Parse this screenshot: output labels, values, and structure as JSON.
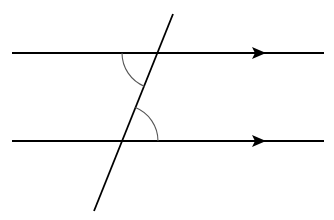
{
  "diagram": {
    "type": "parallel-lines-with-transversal",
    "colors": {
      "line": "#000000",
      "arc": "#555555",
      "background": "#ffffff"
    },
    "parallel_lines": [
      {
        "id": "top-line",
        "x1": 12,
        "y1": 53,
        "x2": 324,
        "y2": 53,
        "arrow_at_x": 266
      },
      {
        "id": "bottom-line",
        "x1": 12,
        "y1": 141,
        "x2": 324,
        "y2": 141,
        "arrow_at_x": 266
      }
    ],
    "transversal": {
      "x1": 173,
      "y1": 14,
      "x2": 94,
      "y2": 211
    },
    "angle_arcs": [
      {
        "id": "upper-angle",
        "center": [
          158,
          53
        ],
        "radius": 36,
        "description": "angle below top line, left of transversal"
      },
      {
        "id": "lower-angle",
        "center": [
          122,
          141
        ],
        "radius": 36,
        "description": "angle above bottom line, right of transversal"
      }
    ]
  }
}
